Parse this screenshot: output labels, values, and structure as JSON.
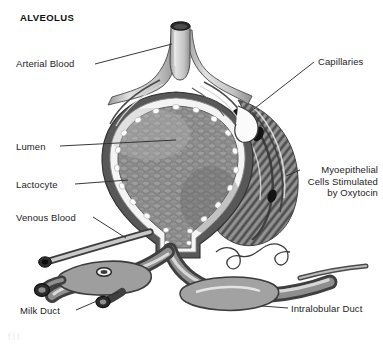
{
  "figure": {
    "title": "ALVEOLUS",
    "style": "grayscale-medical-illustration",
    "colors": {
      "background": "#ffffff",
      "ink": "#1d1d1d",
      "leader_line": "#3a3a3a",
      "duct_wall_dark": "#4a4a4a",
      "duct_wall_mid": "#7e7e7e",
      "duct_lumen_light": "#d6d6d6",
      "alveolus_fill": "#8c8c8c",
      "alveolus_rim": "#f2f2f2",
      "vessel_light": "#cfcfcf",
      "vessel_dark": "#3f3f3f",
      "nucleus": "#161616"
    }
  },
  "labels": {
    "arterial_blood": "Arterial Blood",
    "lumen": "Lumen",
    "lactocyte": "Lactocyte",
    "venous_blood": "Venous Blood",
    "milk_duct": "Milk Duct",
    "capillaries": "Capillaries",
    "myoepithelial_line1": "Myoepithelial",
    "myoepithelial_line2": "Cells Stimulated",
    "myoepithelial_line3": "by Oxytocin",
    "intralobular_duct": "Intralobular Duct",
    "cropped_footer": "f  l  l"
  }
}
